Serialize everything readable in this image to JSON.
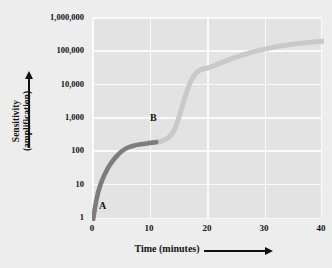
{
  "chart_data": {
    "type": "line",
    "title": "",
    "xlabel": "Time (minutes)",
    "ylabel_line1": "Sensitivity",
    "ylabel_line2": "(amplification)",
    "yscale": "log",
    "xlim": [
      0,
      40
    ],
    "ylim": [
      1,
      1000000
    ],
    "grid": true,
    "legend": "none",
    "xticks": [
      "0",
      "10",
      "20",
      "30",
      "40"
    ],
    "xtick_values": [
      0,
      10,
      20,
      30,
      40
    ],
    "yticks": [
      "1",
      "10",
      "100",
      "1,000",
      "10,000",
      "100,000",
      "1,000,000"
    ],
    "ytick_values": [
      1,
      10,
      100,
      1000,
      10000,
      100000,
      1000000
    ],
    "series": [
      {
        "name": "A",
        "color": "#7d7d7d",
        "points": [
          {
            "x": 0.0,
            "y": 1
          },
          {
            "x": 0.6,
            "y": 4
          },
          {
            "x": 1.2,
            "y": 10
          },
          {
            "x": 2.0,
            "y": 22
          },
          {
            "x": 3.0,
            "y": 45
          },
          {
            "x": 4.0,
            "y": 75
          },
          {
            "x": 5.0,
            "y": 110
          },
          {
            "x": 6.0,
            "y": 140
          },
          {
            "x": 7.0,
            "y": 160
          },
          {
            "x": 8.0,
            "y": 175
          },
          {
            "x": 9.0,
            "y": 185
          },
          {
            "x": 10.0,
            "y": 195
          },
          {
            "x": 11.0,
            "y": 205
          }
        ]
      },
      {
        "name": "B",
        "color": "#c9c9c9",
        "points": [
          {
            "x": 11.0,
            "y": 205
          },
          {
            "x": 12.0,
            "y": 225
          },
          {
            "x": 13.0,
            "y": 270
          },
          {
            "x": 14.0,
            "y": 420
          },
          {
            "x": 15.0,
            "y": 1200
          },
          {
            "x": 16.0,
            "y": 4500
          },
          {
            "x": 17.0,
            "y": 13000
          },
          {
            "x": 18.0,
            "y": 24000
          },
          {
            "x": 19.0,
            "y": 30000
          },
          {
            "x": 20.0,
            "y": 33000
          },
          {
            "x": 22.0,
            "y": 45000
          },
          {
            "x": 25.0,
            "y": 70000
          },
          {
            "x": 28.0,
            "y": 100000
          },
          {
            "x": 31.0,
            "y": 130000
          },
          {
            "x": 34.0,
            "y": 160000
          },
          {
            "x": 37.0,
            "y": 185000
          },
          {
            "x": 40.0,
            "y": 205000
          }
        ]
      }
    ],
    "annotations": [
      {
        "label": "A",
        "x": 2.0,
        "y": 1.6
      },
      {
        "label": "B",
        "x": 10.5,
        "y": 560
      }
    ]
  },
  "colors": {
    "background": "#ededed",
    "plot_field": "#e3e3e3",
    "gridline": "#fbfbfb",
    "segment_a": "#7d7d7d",
    "segment_b": "#c9c9c9",
    "text": "#111111"
  }
}
